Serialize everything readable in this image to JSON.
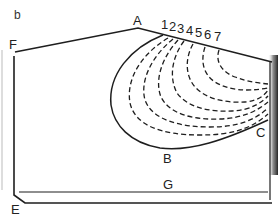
{
  "panel_label": "b",
  "points": {
    "A": "A",
    "B": "B",
    "C": "C",
    "E": "E",
    "F": "F",
    "G": "G"
  },
  "contour_labels": [
    "1",
    "2",
    "3",
    "4",
    "5",
    "6",
    "7"
  ],
  "colors": {
    "line": "#1e1e1e",
    "background": "#ffffff",
    "edge_shadow": "#2a2a2a"
  }
}
